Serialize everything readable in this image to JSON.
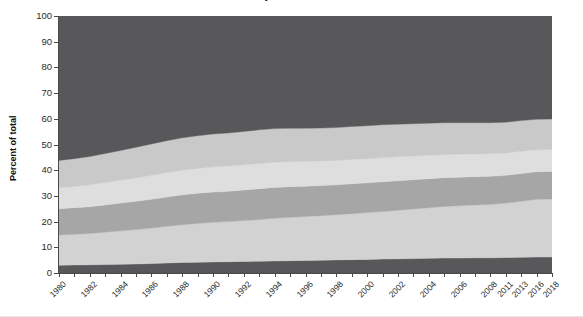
{
  "chart_data": {
    "type": "area",
    "stacked": true,
    "title": "by value chain",
    "xlabel": "",
    "ylabel": "Percent of total",
    "ylim": [
      0,
      100
    ],
    "yticks": [
      0,
      10,
      20,
      30,
      40,
      50,
      60,
      70,
      80,
      90,
      100
    ],
    "grid": false,
    "legend": "none",
    "x": [
      "1980",
      "1981",
      "1982",
      "1983",
      "1984",
      "1985",
      "1986",
      "1987",
      "1988",
      "1989",
      "1990",
      "1991",
      "1992",
      "1993",
      "1994",
      "1995",
      "1996",
      "1997",
      "1998",
      "1999",
      "2000",
      "2001",
      "2002",
      "2003",
      "2004",
      "2005",
      "2006",
      "2007",
      "2008",
      "2011",
      "2013",
      "2016",
      "2018"
    ],
    "xtick_labels": [
      "1980",
      "1982",
      "1984",
      "1986",
      "1988",
      "1990",
      "1992",
      "1994",
      "1996",
      "1998",
      "2000",
      "2002",
      "2004",
      "2006",
      "2008",
      "2011",
      "2013",
      "2016",
      "2018"
    ],
    "series": [
      {
        "name": "band-1-bottom",
        "color": "#58585a",
        "values": [
          3.0,
          3.1,
          3.2,
          3.3,
          3.4,
          3.5,
          3.7,
          3.9,
          4.1,
          4.2,
          4.3,
          4.4,
          4.5,
          4.6,
          4.7,
          4.8,
          4.9,
          5.0,
          5.1,
          5.2,
          5.3,
          5.4,
          5.5,
          5.6,
          5.7,
          5.8,
          5.8,
          5.9,
          5.9,
          6.0,
          6.1,
          6.2,
          6.2
        ]
      },
      {
        "name": "band-2",
        "color": "#d2d2d2",
        "values": [
          11.8,
          12.0,
          12.2,
          12.6,
          13.0,
          13.4,
          13.8,
          14.3,
          14.7,
          15.1,
          15.4,
          15.6,
          15.9,
          16.2,
          16.6,
          16.9,
          17.1,
          17.3,
          17.6,
          17.9,
          18.2,
          18.5,
          18.9,
          19.3,
          19.7,
          20.1,
          20.4,
          20.6,
          20.8,
          21.2,
          21.8,
          22.5,
          22.6
        ]
      },
      {
        "name": "band-3",
        "color": "#a6a6a6",
        "values": [
          10.2,
          10.3,
          10.4,
          10.6,
          10.8,
          11.0,
          11.2,
          11.4,
          11.6,
          11.7,
          11.8,
          11.8,
          11.9,
          12.0,
          12.0,
          11.9,
          11.8,
          11.7,
          11.6,
          11.6,
          11.6,
          11.6,
          11.5,
          11.4,
          11.3,
          11.2,
          11.1,
          11.0,
          10.9,
          10.8,
          10.8,
          10.7,
          10.7
        ]
      },
      {
        "name": "band-4",
        "color": "#dedede",
        "values": [
          8.2,
          8.3,
          8.5,
          8.7,
          8.9,
          9.1,
          9.3,
          9.5,
          9.6,
          9.7,
          9.8,
          9.8,
          9.8,
          9.8,
          9.8,
          9.7,
          9.6,
          9.6,
          9.5,
          9.5,
          9.4,
          9.4,
          9.3,
          9.2,
          9.1,
          9.0,
          8.9,
          8.8,
          8.8,
          8.7,
          8.7,
          8.6,
          8.6
        ]
      },
      {
        "name": "band-5",
        "color": "#c9c9c9",
        "values": [
          10.6,
          10.8,
          11.0,
          11.3,
          11.6,
          11.9,
          12.2,
          12.4,
          12.6,
          12.7,
          12.8,
          12.9,
          13.0,
          13.1,
          13.1,
          13.0,
          12.9,
          12.8,
          12.8,
          12.8,
          12.8,
          12.8,
          12.7,
          12.6,
          12.5,
          12.4,
          12.3,
          12.2,
          12.1,
          12.0,
          11.9,
          11.8,
          11.8
        ]
      },
      {
        "name": "band-6-top",
        "color": "#58585a",
        "values": [
          56.2,
          55.5,
          54.7,
          53.5,
          52.3,
          51.1,
          49.8,
          48.5,
          47.4,
          46.6,
          45.9,
          45.5,
          44.9,
          44.3,
          43.8,
          43.7,
          43.7,
          43.6,
          43.4,
          43.0,
          42.7,
          42.3,
          42.1,
          41.9,
          41.7,
          41.5,
          41.5,
          41.5,
          41.5,
          41.3,
          40.7,
          40.2,
          40.1
        ]
      }
    ]
  },
  "axis": {
    "y_title": "Percent of total"
  }
}
